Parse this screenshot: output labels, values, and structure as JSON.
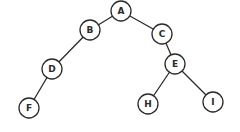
{
  "diagram": {
    "type": "binary-tree",
    "stroke_color": "#2a2a2a",
    "background": "#ffffff",
    "node_radius": 10,
    "nodes": [
      {
        "id": "A",
        "label": "A",
        "x": 121,
        "y": 11
      },
      {
        "id": "B",
        "label": "B",
        "x": 90,
        "y": 30
      },
      {
        "id": "C",
        "label": "C",
        "x": 162,
        "y": 34
      },
      {
        "id": "D",
        "label": "D",
        "x": 52,
        "y": 69
      },
      {
        "id": "E",
        "label": "E",
        "x": 175,
        "y": 64
      },
      {
        "id": "F",
        "label": "F",
        "x": 29,
        "y": 108
      },
      {
        "id": "H",
        "label": "H",
        "x": 148,
        "y": 104
      },
      {
        "id": "I",
        "label": "I",
        "x": 213,
        "y": 102
      }
    ],
    "edges": [
      {
        "from": "A",
        "to": "B"
      },
      {
        "from": "A",
        "to": "C"
      },
      {
        "from": "B",
        "to": "D"
      },
      {
        "from": "D",
        "to": "F"
      },
      {
        "from": "C",
        "to": "E"
      },
      {
        "from": "E",
        "to": "H"
      },
      {
        "from": "E",
        "to": "I"
      }
    ]
  }
}
